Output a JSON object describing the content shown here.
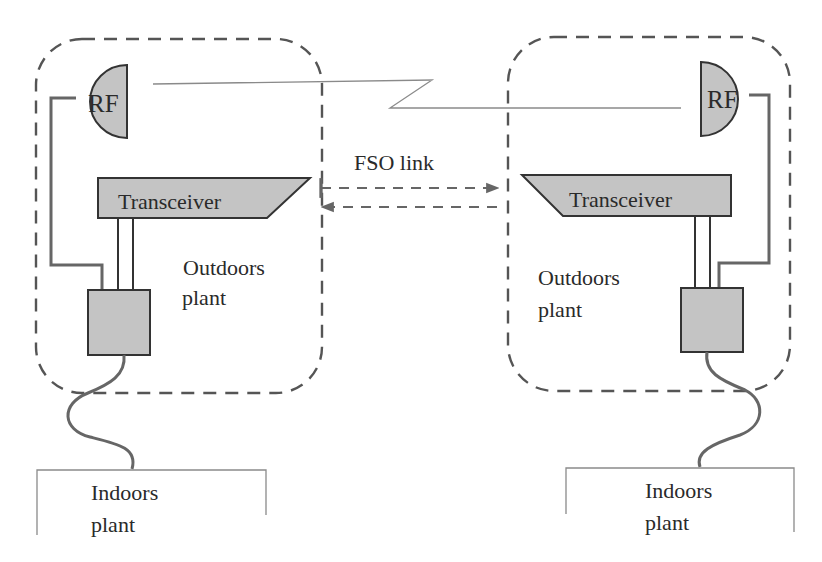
{
  "diagram": {
    "colors": {
      "component_fill": "#c4c4c4",
      "component_stroke": "#333333",
      "dashed_boundary": "#555555",
      "cable": "#666666",
      "rf_link_line": "#8a8a8a",
      "text": "#2a2a2a"
    },
    "link": {
      "fso_label": "FSO link",
      "rf_link": "zigzag line between RF antennas"
    },
    "left_site": {
      "rf_label": "RF",
      "transceiver_label": "Transceiver",
      "outdoors_label_line1": "Outdoors",
      "outdoors_label_line2": "plant",
      "indoors_label_line1": "Indoors",
      "indoors_label_line2": "plant"
    },
    "right_site": {
      "rf_label": "RF",
      "transceiver_label": "Transceiver",
      "outdoors_label_line1": "Outdoors",
      "outdoors_label_line2": "plant",
      "indoors_label_line1": "Indoors",
      "indoors_label_line2": "plant"
    },
    "icons": {
      "rf_antenna": "half-circle-dish-icon",
      "transceiver": "trapezoid-block-icon",
      "power_unit": "square-box-icon",
      "fso_arrow": "dashed-arrow-icon"
    }
  }
}
